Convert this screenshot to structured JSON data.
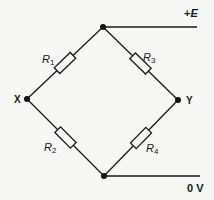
{
  "diagram": {
    "type": "wheatstone-bridge",
    "nodes": {
      "top": {
        "x": 103,
        "y": 27
      },
      "left": {
        "x": 27,
        "y": 99,
        "label": "X"
      },
      "right": {
        "x": 178,
        "y": 100,
        "label": "Y"
      },
      "bottom": {
        "x": 104,
        "y": 176
      }
    },
    "resistors": [
      {
        "name": "R",
        "sub": "1",
        "from": "top",
        "to": "left"
      },
      {
        "name": "R",
        "sub": "3",
        "from": "top",
        "to": "right"
      },
      {
        "name": "R",
        "sub": "2",
        "from": "left",
        "to": "bottom"
      },
      {
        "name": "R",
        "sub": "4",
        "from": "right",
        "to": "bottom"
      }
    ],
    "terminals": {
      "supply": {
        "label": "+E",
        "plus": "+",
        "symbol": "E"
      },
      "ground": {
        "label": "0 V"
      }
    },
    "colors": {
      "line": "#1a1a1a",
      "background": "#f7f7f5"
    }
  }
}
